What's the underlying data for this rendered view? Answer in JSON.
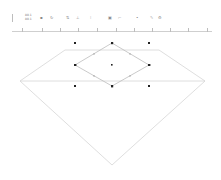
{
  "toolbar": {
    "coord_x": "80.1",
    "coord_y": "80.1",
    "buttons": [
      {
        "name": "arrange-icon",
        "glyph": "▪"
      },
      {
        "name": "rotate-icon",
        "glyph": "↻"
      },
      {
        "name": "flip-icon",
        "glyph": "⇅"
      },
      {
        "name": "align-icon",
        "glyph": "⊥"
      },
      {
        "name": "distribute-icon",
        "glyph": "⁝"
      },
      {
        "name": "group-icon",
        "glyph": "▣"
      },
      {
        "name": "connect-icon",
        "glyph": "⤚"
      },
      {
        "name": "point-icon",
        "glyph": "•"
      },
      {
        "name": "edit-icon",
        "glyph": "✎"
      },
      {
        "name": "settings-icon",
        "glyph": "⚙"
      }
    ]
  },
  "ruler": {
    "major_ticks": 11
  },
  "canvas": {
    "shape": "diamond",
    "stroke_color": "#d6d6d6",
    "inner_diamond_color": "#bcbcbc",
    "handle_color": "#222222"
  }
}
